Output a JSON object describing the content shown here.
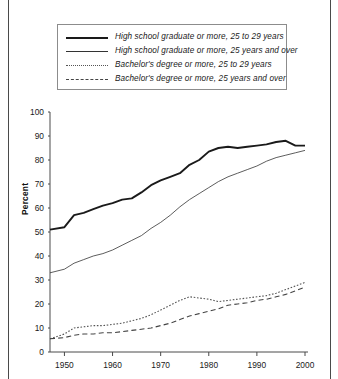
{
  "legend": {
    "items": [
      {
        "label": "High school graduate or more, 25 to 29 years",
        "style": "thick-solid",
        "color": "#1a1a1a"
      },
      {
        "label": "High school graduate or more, 25 years and over",
        "style": "thin-solid",
        "color": "#333333"
      },
      {
        "label": "Bachelor's degree or more, 25 to 29 years",
        "style": "dotted",
        "color": "#555555"
      },
      {
        "label": "Bachelor's degree or more, 25 years and over",
        "style": "dashed",
        "color": "#444444"
      }
    ]
  },
  "axes": {
    "ylabel": "Percent",
    "yticks": [
      "0",
      "10",
      "20",
      "30",
      "40",
      "50",
      "60",
      "70",
      "80",
      "90",
      "100"
    ],
    "xticks": [
      "1950",
      "1960",
      "1970",
      "1980",
      "1990",
      "2000"
    ]
  },
  "footnote": {
    "text": ""
  },
  "chart_data": {
    "type": "line",
    "title": "",
    "xlabel": "",
    "ylabel": "Percent",
    "xlim": [
      1947,
      2000
    ],
    "ylim": [
      0,
      100
    ],
    "yticks": [
      0,
      10,
      20,
      30,
      40,
      50,
      60,
      70,
      80,
      90,
      100
    ],
    "xticks": [
      1950,
      1960,
      1970,
      1980,
      1990,
      2000
    ],
    "grid": false,
    "legend_position": "above-plot",
    "x": [
      1947,
      1950,
      1952,
      1954,
      1956,
      1958,
      1960,
      1962,
      1964,
      1966,
      1968,
      1970,
      1972,
      1974,
      1976,
      1978,
      1980,
      1982,
      1984,
      1986,
      1988,
      1990,
      1992,
      1994,
      1996,
      1998,
      2000
    ],
    "series": [
      {
        "name": "High school graduate or more, 25 to 29 years",
        "style": "thick-solid",
        "color": "#1a1a1a",
        "values": [
          51.0,
          52.0,
          57.0,
          58.0,
          59.5,
          61.0,
          62.0,
          63.5,
          64.0,
          66.5,
          69.5,
          71.5,
          73.0,
          74.5,
          78.0,
          80.0,
          83.5,
          85.0,
          85.5,
          85.0,
          85.5,
          86.0,
          86.5,
          87.5,
          88.0,
          86.0,
          86.0
        ]
      },
      {
        "name": "High school graduate or more, 25 years and over",
        "style": "thin-solid",
        "color": "#333333",
        "values": [
          33.0,
          34.5,
          37.0,
          38.5,
          40.0,
          41.0,
          42.5,
          44.5,
          46.5,
          48.5,
          51.5,
          54.0,
          57.0,
          60.5,
          63.5,
          66.0,
          68.5,
          71.0,
          73.0,
          74.5,
          76.0,
          77.5,
          79.5,
          81.0,
          82.0,
          83.0,
          84.0
        ]
      },
      {
        "name": "Bachelor's degree or more, 25 to 29 years",
        "style": "dotted",
        "color": "#555555",
        "values": [
          5.5,
          7.5,
          10.0,
          10.5,
          11.0,
          11.0,
          11.5,
          12.0,
          13.0,
          14.0,
          15.5,
          17.5,
          19.5,
          21.5,
          23.0,
          22.5,
          22.0,
          21.0,
          21.5,
          22.0,
          22.5,
          23.0,
          23.5,
          24.5,
          26.0,
          27.5,
          29.0
        ]
      },
      {
        "name": "Bachelor's degree or more, 25 years and over",
        "style": "dashed",
        "color": "#444444",
        "values": [
          5.5,
          6.0,
          7.0,
          7.5,
          7.5,
          8.0,
          8.0,
          8.5,
          9.0,
          9.5,
          10.0,
          11.0,
          12.0,
          13.5,
          15.0,
          16.0,
          17.0,
          18.0,
          19.5,
          20.0,
          20.5,
          21.5,
          22.0,
          23.0,
          24.0,
          25.5,
          27.0
        ]
      }
    ]
  }
}
